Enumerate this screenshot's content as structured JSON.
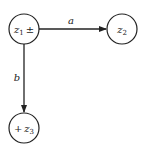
{
  "diagram": {
    "type": "directed-graph",
    "nodes": [
      {
        "id": "z1",
        "base": "z",
        "sub": "1",
        "prefix": "",
        "suffix": "±",
        "cx": 24,
        "cy": 29,
        "r": 15
      },
      {
        "id": "z2",
        "base": "z",
        "sub": "2",
        "prefix": "",
        "suffix": "",
        "cx": 122,
        "cy": 29,
        "r": 15
      },
      {
        "id": "z3",
        "base": "z",
        "sub": "3",
        "prefix": "+",
        "suffix": "",
        "cx": 24,
        "cy": 128,
        "r": 15
      }
    ],
    "edges": [
      {
        "from": "z1",
        "to": "z2",
        "label": "a"
      },
      {
        "from": "z1",
        "to": "z3",
        "label": "b"
      }
    ],
    "colors": {
      "stroke": "#222222",
      "background": "#ffffff"
    }
  }
}
